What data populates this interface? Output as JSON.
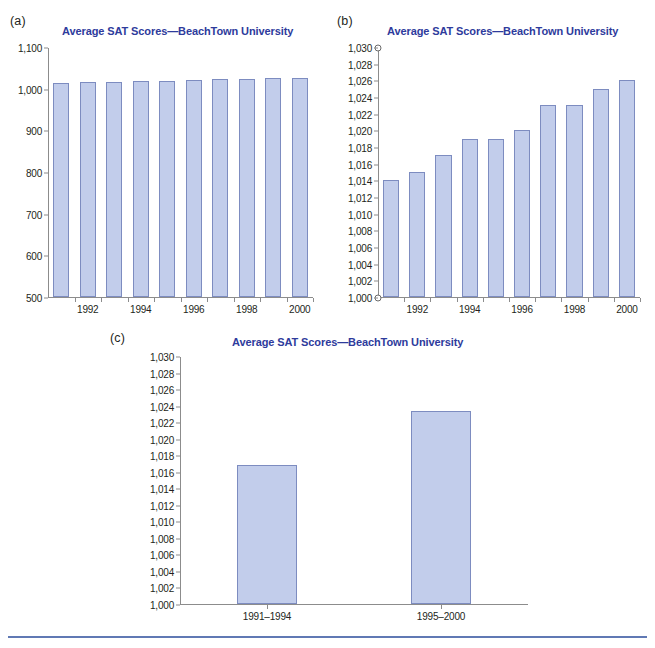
{
  "figure": {
    "background_color": "#ffffff",
    "bar_fill_color": "#c2cdeb",
    "bar_border_color": "#7d8cc0",
    "title_color": "#2e3b9c",
    "axis_color": "#8c8c8c",
    "footer_rule_color": "#6079b4"
  },
  "panels": {
    "a": {
      "label": "(a)",
      "title": "Average SAT Scores—BeachTown University"
    },
    "b": {
      "label": "(b)",
      "title": "Average SAT Scores—BeachTown University"
    },
    "c": {
      "label": "(c)",
      "title": "Average SAT Scores—BeachTown University"
    }
  },
  "chart_data": [
    {
      "panel": "a",
      "type": "bar",
      "title": "Average SAT Scores—BeachTown University",
      "xlabel": "",
      "ylabel": "",
      "categories": [
        "1991",
        "1992",
        "1993",
        "1994",
        "1995",
        "1996",
        "1997",
        "1998",
        "1999",
        "2000"
      ],
      "tick_labels_shown": [
        "",
        "1992",
        "",
        "1994",
        "",
        "1996",
        "",
        "1998",
        "",
        "2000"
      ],
      "values": [
        1014,
        1015,
        1017,
        1019,
        1019,
        1020,
        1023,
        1023,
        1025,
        1026
      ],
      "ylim": [
        500,
        1100
      ],
      "ytick_values": [
        500,
        600,
        700,
        800,
        900,
        1000,
        1100
      ],
      "ytick_labels": [
        "500",
        "600",
        "700",
        "800",
        "900",
        "1,000",
        "1,100"
      ],
      "grid": false,
      "legend": false
    },
    {
      "panel": "b",
      "type": "bar",
      "title": "Average SAT Scores—BeachTown University",
      "xlabel": "",
      "ylabel": "",
      "categories": [
        "1991",
        "1992",
        "1993",
        "1994",
        "1995",
        "1996",
        "1997",
        "1998",
        "1999",
        "2000"
      ],
      "tick_labels_shown": [
        "",
        "1992",
        "",
        "1994",
        "",
        "1996",
        "",
        "1998",
        "",
        "2000"
      ],
      "values": [
        1014,
        1015,
        1017,
        1019,
        1019,
        1020,
        1023,
        1023,
        1025,
        1026
      ],
      "ylim": [
        1000,
        1030
      ],
      "ytick_values": [
        1000,
        1002,
        1004,
        1006,
        1008,
        1010,
        1012,
        1014,
        1016,
        1018,
        1020,
        1022,
        1024,
        1026,
        1028,
        1030
      ],
      "ytick_labels": [
        "1,000",
        "1,002",
        "1,004",
        "1,006",
        "1,008",
        "1,010",
        "1,012",
        "1,014",
        "1,016",
        "1,018",
        "1,020",
        "1,022",
        "1,024",
        "1,026",
        "1,028",
        "1,030"
      ],
      "grid": false,
      "legend": false,
      "axis_break_markers": true
    },
    {
      "panel": "c",
      "type": "bar",
      "title": "Average SAT Scores—BeachTown University",
      "xlabel": "",
      "ylabel": "",
      "categories": [
        "1991–1994",
        "1995–2000"
      ],
      "values": [
        1016.8,
        1023.4
      ],
      "ylim": [
        1000,
        1030
      ],
      "ytick_values": [
        1000,
        1002,
        1004,
        1006,
        1008,
        1010,
        1012,
        1014,
        1016,
        1018,
        1020,
        1022,
        1024,
        1026,
        1028,
        1030
      ],
      "ytick_labels": [
        "1,000",
        "1,002",
        "1,004",
        "1,006",
        "1,008",
        "1,010",
        "1,012",
        "1,014",
        "1,016",
        "1,018",
        "1,020",
        "1,022",
        "1,024",
        "1,026",
        "1,028",
        "1,030"
      ],
      "grid": false,
      "legend": false
    }
  ]
}
